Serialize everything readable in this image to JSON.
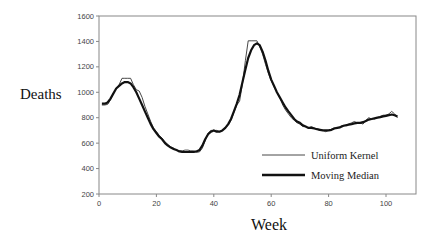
{
  "chart_data": {
    "type": "line",
    "title": "",
    "xlabel": "Week",
    "ylabel": "Deaths",
    "xlim": [
      0,
      110
    ],
    "ylim": [
      200,
      1600
    ],
    "xticks": [
      0,
      20,
      40,
      60,
      80,
      100
    ],
    "yticks": [
      200,
      400,
      600,
      800,
      1000,
      1200,
      1400,
      1600
    ],
    "grid": false,
    "legend_position": "lower right (inside)",
    "series": [
      {
        "name": "Uniform Kernel",
        "style": "thin",
        "color": "#333333",
        "x": [
          1,
          2,
          3,
          4,
          5,
          6,
          7,
          8,
          9,
          10,
          11,
          12,
          13,
          14,
          15,
          16,
          17,
          18,
          19,
          20,
          21,
          22,
          23,
          24,
          25,
          26,
          27,
          28,
          29,
          30,
          31,
          32,
          33,
          34,
          35,
          36,
          37,
          38,
          39,
          40,
          41,
          42,
          43,
          44,
          45,
          46,
          47,
          48,
          49,
          50,
          51,
          52,
          53,
          54,
          55,
          56,
          57,
          58,
          59,
          60,
          61,
          62,
          63,
          64,
          65,
          66,
          67,
          68,
          69,
          70,
          71,
          72,
          73,
          74,
          75,
          76,
          77,
          78,
          79,
          80,
          81,
          82,
          83,
          84,
          85,
          86,
          87,
          88,
          89,
          90,
          91,
          92,
          93,
          94,
          95,
          96,
          97,
          98,
          99,
          100,
          101,
          102,
          103,
          104
        ],
        "values": [
          900,
          900,
          905,
          940,
          990,
          1030,
          1060,
          1110,
          1110,
          1110,
          1110,
          1060,
          1020,
          1010,
          960,
          890,
          830,
          770,
          720,
          690,
          660,
          640,
          610,
          590,
          570,
          560,
          545,
          540,
          540,
          545,
          545,
          540,
          540,
          530,
          530,
          560,
          620,
          680,
          700,
          700,
          700,
          690,
          700,
          720,
          740,
          780,
          840,
          900,
          930,
          1070,
          1250,
          1405,
          1405,
          1405,
          1405,
          1360,
          1300,
          1220,
          1150,
          1090,
          1040,
          1000,
          960,
          900,
          860,
          830,
          800,
          780,
          760,
          750,
          730,
          730,
          720,
          730,
          720,
          710,
          700,
          700,
          690,
          700,
          710,
          720,
          720,
          730,
          740,
          740,
          750,
          760,
          770,
          760,
          760,
          750,
          780,
          800,
          790,
          790,
          800,
          810,
          820,
          820,
          830,
          850,
          830,
          800
        ]
      },
      {
        "name": "Moving Median",
        "style": "thick",
        "color": "#111111",
        "x": [
          1,
          2,
          3,
          4,
          5,
          6,
          7,
          8,
          9,
          10,
          11,
          12,
          13,
          14,
          15,
          16,
          17,
          18,
          19,
          20,
          21,
          22,
          23,
          24,
          25,
          26,
          27,
          28,
          29,
          30,
          31,
          32,
          33,
          34,
          35,
          36,
          37,
          38,
          39,
          40,
          41,
          42,
          43,
          44,
          45,
          46,
          47,
          48,
          49,
          50,
          51,
          52,
          53,
          54,
          55,
          56,
          57,
          58,
          59,
          60,
          61,
          62,
          63,
          64,
          65,
          66,
          67,
          68,
          69,
          70,
          71,
          72,
          73,
          74,
          75,
          76,
          77,
          78,
          79,
          80,
          81,
          82,
          83,
          84,
          85,
          86,
          87,
          88,
          89,
          90,
          91,
          92,
          93,
          94,
          95,
          96,
          97,
          98,
          99,
          100,
          101,
          102,
          103,
          104
        ],
        "values": [
          910,
          910,
          920,
          950,
          990,
          1030,
          1050,
          1070,
          1080,
          1080,
          1070,
          1040,
          1000,
          950,
          900,
          850,
          800,
          750,
          710,
          680,
          650,
          630,
          600,
          580,
          565,
          555,
          545,
          535,
          530,
          530,
          530,
          530,
          530,
          535,
          545,
          580,
          630,
          670,
          690,
          700,
          690,
          690,
          700,
          720,
          750,
          790,
          850,
          910,
          980,
          1080,
          1180,
          1270,
          1330,
          1370,
          1385,
          1370,
          1320,
          1250,
          1170,
          1100,
          1050,
          1000,
          960,
          920,
          880,
          850,
          820,
          790,
          770,
          760,
          740,
          730,
          720,
          720,
          715,
          710,
          705,
          700,
          700,
          700,
          705,
          715,
          720,
          725,
          735,
          740,
          745,
          750,
          755,
          760,
          760,
          765,
          775,
          785,
          790,
          795,
          800,
          805,
          810,
          815,
          820,
          825,
          820,
          810
        ]
      }
    ],
    "legend": [
      {
        "label": "Uniform Kernel",
        "style": "thin"
      },
      {
        "label": "Moving Median",
        "style": "thick"
      }
    ]
  }
}
